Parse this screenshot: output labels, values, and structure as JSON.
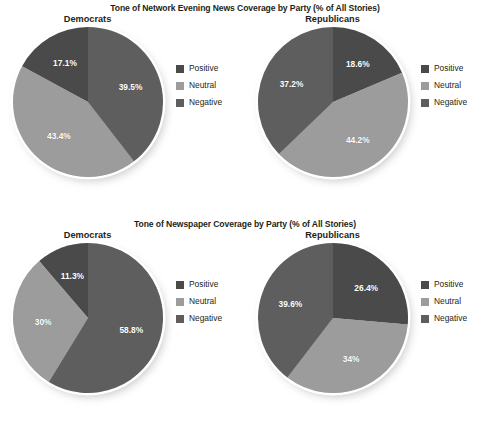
{
  "colors": {
    "positive": "#4a4a4a",
    "neutral": "#9c9c9c",
    "negative": "#5e5e5e",
    "background": "#ffffff",
    "text": "#231f20",
    "label_text": "#ffffff"
  },
  "legend": {
    "positive_label": "Positive",
    "neutral_label": "Neutral",
    "negative_label": "Negative"
  },
  "sections": [
    {
      "title": "Tone of Network Evening News Coverage by Party (% of All Stories)",
      "panels": [
        {
          "title": "Democrats",
          "labels": {
            "positive": "17.1%",
            "neutral": "43.4%",
            "negative": "39.5%"
          }
        },
        {
          "title": "Republicans",
          "labels": {
            "positive": "18.6%",
            "neutral": "44.2%",
            "negative": "37.2%"
          }
        }
      ]
    },
    {
      "title": "Tone of Newspaper Coverage by Party (% of All Stories)",
      "panels": [
        {
          "title": "Democrats",
          "labels": {
            "positive": "11.3%",
            "neutral": "30%",
            "negative": "58.8%"
          }
        },
        {
          "title": "Republicans",
          "labels": {
            "positive": "26.4%",
            "neutral": "34%",
            "negative": "39.6%"
          }
        }
      ]
    }
  ],
  "chart_data": [
    {
      "type": "pie",
      "title": "Tone of Network Evening News Coverage by Party (% of All Stories)",
      "subtitle": "Democrats",
      "categories": [
        "Positive",
        "Neutral",
        "Negative"
      ],
      "values": [
        17.1,
        43.4,
        39.5
      ],
      "value_labels": [
        "17.1%",
        "43.4%",
        "39.5%"
      ],
      "units": "% of All Stories",
      "legend_position": "right",
      "start_angle_deg": 0,
      "direction": "counterclockwise",
      "colors": [
        "#4a4a4a",
        "#9c9c9c",
        "#5e5e5e"
      ]
    },
    {
      "type": "pie",
      "title": "Tone of Network Evening News Coverage by Party (% of All Stories)",
      "subtitle": "Republicans",
      "categories": [
        "Positive",
        "Neutral",
        "Negative"
      ],
      "values": [
        18.6,
        44.2,
        37.2
      ],
      "value_labels": [
        "18.6%",
        "44.2%",
        "37.2%"
      ],
      "units": "% of All Stories",
      "legend_position": "right",
      "start_angle_deg": 0,
      "direction": "clockwise",
      "colors": [
        "#4a4a4a",
        "#9c9c9c",
        "#5e5e5e"
      ]
    },
    {
      "type": "pie",
      "title": "Tone of Newspaper Coverage by Party (% of All Stories)",
      "subtitle": "Democrats",
      "categories": [
        "Positive",
        "Neutral",
        "Negative"
      ],
      "values": [
        11.3,
        30.0,
        58.8
      ],
      "value_labels": [
        "11.3%",
        "30%",
        "58.8%"
      ],
      "units": "% of All Stories",
      "legend_position": "right",
      "start_angle_deg": 0,
      "direction": "counterclockwise",
      "colors": [
        "#4a4a4a",
        "#9c9c9c",
        "#5e5e5e"
      ]
    },
    {
      "type": "pie",
      "title": "Tone of Newspaper Coverage by Party (% of All Stories)",
      "subtitle": "Republicans",
      "categories": [
        "Positive",
        "Neutral",
        "Negative"
      ],
      "values": [
        26.4,
        34.0,
        39.6
      ],
      "value_labels": [
        "26.4%",
        "34%",
        "39.6%"
      ],
      "units": "% of All Stories",
      "legend_position": "right",
      "start_angle_deg": 0,
      "direction": "clockwise",
      "colors": [
        "#4a4a4a",
        "#9c9c9c",
        "#5e5e5e"
      ]
    }
  ]
}
